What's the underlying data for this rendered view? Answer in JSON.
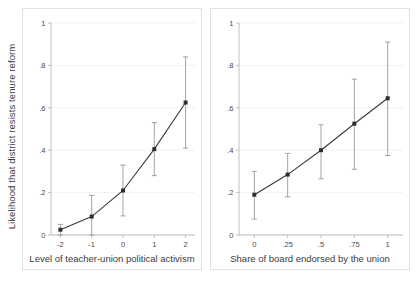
{
  "figure": {
    "background": "#ffffff",
    "axis_color": "#b9b9b9",
    "grid_color": "#ededed",
    "marker_color": "#2e2e2e",
    "errorbar_color": "#9a9a9a",
    "line_color": "#3a3a3a",
    "shared_ylabel": "Likelihood that district resists tenure reform"
  },
  "chart_data": [
    {
      "type": "line",
      "panel": "left",
      "title": "",
      "xlabel": "Level of teacher-union political activism",
      "ylabel": "Likelihood that district resists tenure reform",
      "xlim": [
        -2.3,
        2.3
      ],
      "ylim": [
        0,
        1
      ],
      "xticks": [
        -2,
        -1,
        0,
        1,
        2
      ],
      "xticklabels": [
        "-2",
        "-1",
        "0",
        "1",
        "2"
      ],
      "yticks": [
        0,
        0.2,
        0.4,
        0.6,
        0.8,
        1
      ],
      "yticklabels": [
        "0",
        ".2",
        ".4",
        ".6",
        ".8",
        "1"
      ],
      "grid": true,
      "legend": "none",
      "x": [
        -2,
        -1,
        0,
        1,
        2
      ],
      "values": [
        0.025,
        0.087,
        0.21,
        0.405,
        0.625
      ],
      "ci_lower": [
        0.0,
        0.0,
        0.09,
        0.28,
        0.41
      ],
      "ci_upper": [
        0.05,
        0.187,
        0.33,
        0.53,
        0.84
      ]
    },
    {
      "type": "line",
      "panel": "right",
      "title": "",
      "xlabel": "Share of board endorsed by the union",
      "ylabel": "Likelihood that district resists tenure reform",
      "xlim": [
        -0.115,
        1.115
      ],
      "ylim": [
        0,
        1
      ],
      "xticks": [
        0,
        0.25,
        0.5,
        0.75,
        1
      ],
      "xticklabels": [
        "0",
        ".25",
        ".5",
        ".75",
        "1"
      ],
      "yticks": [
        0,
        0.2,
        0.4,
        0.6,
        0.8,
        1
      ],
      "yticklabels": [
        "0",
        ".2",
        ".4",
        ".6",
        ".8",
        "1"
      ],
      "grid": true,
      "legend": "none",
      "x": [
        0,
        0.25,
        0.5,
        0.75,
        1
      ],
      "values": [
        0.19,
        0.285,
        0.4,
        0.525,
        0.645
      ],
      "ci_lower": [
        0.075,
        0.18,
        0.265,
        0.31,
        0.375
      ],
      "ci_upper": [
        0.3,
        0.385,
        0.52,
        0.735,
        0.91
      ]
    }
  ]
}
